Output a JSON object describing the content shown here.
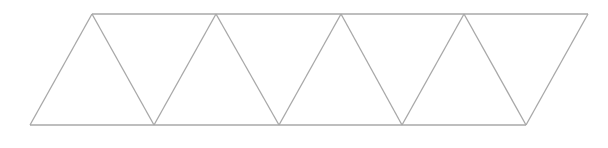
{
  "diagram": {
    "stroke_color": "#a8a8a8",
    "background": "#ffffff",
    "top_vertices_x": [
      92,
      216,
      341,
      464,
      588
    ],
    "bottom_vertices_x": [
      30,
      154,
      279,
      402,
      526
    ],
    "top_y": 14,
    "bottom_y": 125,
    "triangle_count": 9
  }
}
